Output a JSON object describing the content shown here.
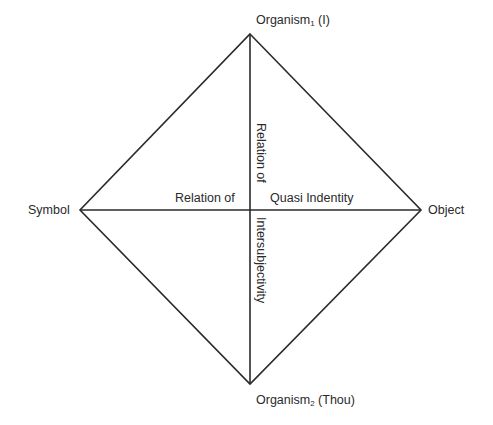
{
  "diagram": {
    "type": "diamond-relation-diagram",
    "line_color": "#2a2a2a",
    "vertices": {
      "top": {
        "label_main": "Organism",
        "label_sub": "1",
        "label_suffix": " (I)"
      },
      "bottom": {
        "label_main": "Organism",
        "label_sub": "2",
        "label_suffix": " (Thou)"
      },
      "left": {
        "label": "Symbol"
      },
      "right": {
        "label": "Object"
      }
    },
    "axis_labels": {
      "horizontal_left": "Relation of",
      "horizontal_right": "Quasi Indentity",
      "vertical_top": "Relation of",
      "vertical_bottom": "Intersubjectivity"
    }
  }
}
